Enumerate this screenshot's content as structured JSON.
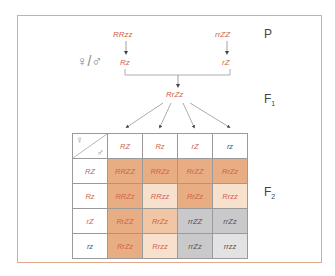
{
  "diagram": {
    "generations": {
      "p": "P",
      "f1": "F",
      "f1_sub": "1",
      "f2": "F",
      "f2_sub": "2"
    },
    "parents": {
      "left": "RRzz",
      "right": "rrZZ"
    },
    "gametes": {
      "left": "Rz",
      "right": "rZ"
    },
    "sex_symbols": "♀/♂",
    "f1_genotype": "RrZz",
    "colors": {
      "frame": "#e0a88c",
      "text_red": "#d0644a",
      "text_dark": "#555555",
      "dark_orange": "#e8ad82",
      "medium_orange": "#f0c6a4",
      "light_orange": "#f7e1cd",
      "gray": "#c9c9cb",
      "light_gray": "#e2e2e4"
    }
  },
  "punnett": {
    "corner": {
      "female": "♀",
      "male": "♂"
    },
    "column_headers": [
      "RZ",
      "Rz",
      "rZ",
      "rz"
    ],
    "row_headers": [
      "RZ",
      "Rz",
      "rZ",
      "rz"
    ],
    "cells": [
      [
        "RRZZ",
        "RRZz",
        "RrZZ",
        "RrZz"
      ],
      [
        "RRZz",
        "RRzz",
        "RrZz",
        "Rrzz"
      ],
      [
        "RrZZ",
        "RrZz",
        "rrZZ",
        "rrZz"
      ],
      [
        "RrZz",
        "Rrzz",
        "rrZz",
        "rrzz"
      ]
    ]
  }
}
